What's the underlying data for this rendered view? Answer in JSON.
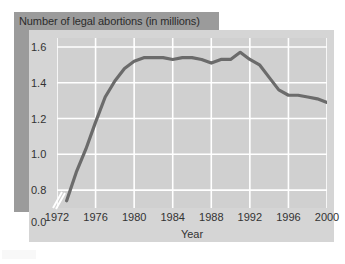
{
  "chart_data": {
    "type": "line",
    "title": "Number of legal abortions (in millions)",
    "xlabel": "Year",
    "ylabel": "",
    "xlim": [
      1972,
      2000
    ],
    "ylim": [
      0.7,
      1.65
    ],
    "grid": true,
    "legend": "none",
    "axis_break": true,
    "xticks": [
      "1972",
      "1976",
      "1980",
      "1984",
      "1988",
      "1992",
      "1996",
      "2000"
    ],
    "yticks": [
      "0.0",
      "0.8",
      "1.0",
      "1.2",
      "1.4",
      "1.6"
    ],
    "line_color": "#6b6b6b",
    "x": [
      1973,
      1974,
      1975,
      1976,
      1977,
      1978,
      1979,
      1980,
      1981,
      1982,
      1983,
      1984,
      1985,
      1986,
      1987,
      1988,
      1989,
      1990,
      1991,
      1992,
      1993,
      1994,
      1995,
      1996,
      1997,
      1998,
      1999,
      2000
    ],
    "values": [
      0.74,
      0.9,
      1.03,
      1.18,
      1.32,
      1.41,
      1.48,
      1.52,
      1.54,
      1.54,
      1.54,
      1.53,
      1.54,
      1.54,
      1.53,
      1.51,
      1.53,
      1.53,
      1.57,
      1.53,
      1.5,
      1.43,
      1.36,
      1.33,
      1.33,
      1.32,
      1.31,
      1.29
    ],
    "series_name": "Legal abortions"
  },
  "figure": {
    "title_banner_color": "#9b9b9b",
    "panel_color": "#d5d5d5",
    "plot_color": "#d0d0d0",
    "grid_color": "#ffffff"
  }
}
